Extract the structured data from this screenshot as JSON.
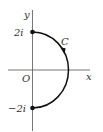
{
  "diagram": {
    "axes": {
      "x_label": "x",
      "y_label": "y",
      "origin_label": "O"
    },
    "points": [
      {
        "label": "2i",
        "x": 0,
        "y": 2
      },
      {
        "label": "−2i",
        "x": 0,
        "y": -2
      }
    ],
    "curve": {
      "label": "C",
      "description": "right semicircle from 2i to -2i, oriented clockwise",
      "direction": "from 2i to -2i"
    },
    "colors": {
      "axis": "#555555",
      "curve": "#111111",
      "text": "#333333"
    }
  }
}
